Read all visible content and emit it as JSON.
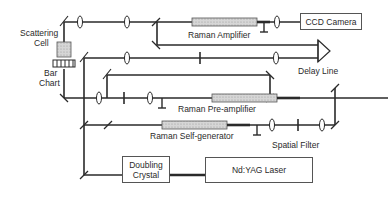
{
  "diagram": {
    "type": "optical-setup-schematic",
    "components": {
      "ccd_camera": "CCD Camera",
      "raman_amplifier": "Raman Amplifier",
      "delay_line": "Delay Line",
      "raman_preamplifier": "Raman Pre-amplifier",
      "raman_self_generator": "Raman Self-generator",
      "spatial_filter": "Spatial Filter",
      "doubling_crystal_line1": "Doubling",
      "doubling_crystal_line2": "Crystal",
      "nd_yag_laser": "Nd:YAG Laser",
      "scattering_cell_line1": "Scattering",
      "scattering_cell_line2": "Cell",
      "bar_chart_line1": "Bar",
      "bar_chart_line2": "Chart"
    },
    "colors": {
      "beam": "#2a2a2a",
      "box_border": "#555555",
      "raman_cell_fill": "#cfcfcf",
      "background": "#ffffff"
    }
  }
}
